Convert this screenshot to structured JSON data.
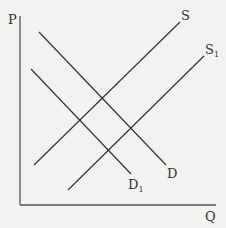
{
  "diagram": {
    "type": "supply-demand",
    "axes": {
      "y_label": "P",
      "x_label": "Q"
    },
    "curves": [
      {
        "id": "D",
        "label": "D",
        "subscript": "",
        "x1": 39,
        "y1": 32,
        "x2": 166,
        "y2": 165
      },
      {
        "id": "D1",
        "label": "D",
        "subscript": "1",
        "x1": 31,
        "y1": 69,
        "x2": 131,
        "y2": 174
      },
      {
        "id": "S",
        "label": "S",
        "subscript": "",
        "x1": 34,
        "y1": 165,
        "x2": 180,
        "y2": 22
      },
      {
        "id": "S1",
        "label": "S",
        "subscript": "1",
        "x1": 68,
        "y1": 190,
        "x2": 204,
        "y2": 56
      }
    ],
    "colors": {
      "background": "#f2f2f0",
      "line": "#333333",
      "axis": "#555555"
    }
  }
}
